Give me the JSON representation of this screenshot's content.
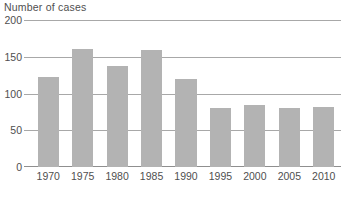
{
  "chart_data": {
    "type": "bar",
    "title": "Number of cases",
    "xlabel": "",
    "ylabel": "Number of cases",
    "categories": [
      "1970",
      "1975",
      "1980",
      "1985",
      "1990",
      "1995",
      "2000",
      "2005",
      "2010"
    ],
    "values": [
      122,
      160,
      138,
      159,
      120,
      80,
      85,
      80,
      81
    ],
    "ylim": [
      0,
      200
    ],
    "yticks": [
      "0",
      "50",
      "100",
      "150",
      "200"
    ],
    "ytick_values": [
      0,
      50,
      100,
      150,
      200
    ],
    "grid": true,
    "legend": "none",
    "bar_color": "#b3b3b3",
    "gridline_color": "#a8a8a8",
    "text_color": "#4f4f4f",
    "background_color": "#ffffff"
  }
}
